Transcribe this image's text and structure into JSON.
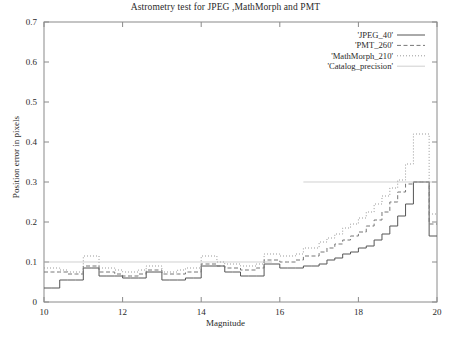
{
  "chart_data": {
    "type": "line",
    "title": "Astrometry test for JPEG ,MathMorph and PMT",
    "xlabel": "Magnitude",
    "ylabel": "Position error in pixels",
    "xlim": [
      10,
      20
    ],
    "ylim": [
      0,
      0.7
    ],
    "xticks": [
      10,
      12,
      14,
      16,
      18,
      20
    ],
    "xtick_labels": [
      "10",
      "12",
      "14",
      "16",
      "18",
      "20"
    ],
    "yticks": [
      0,
      0.1,
      0.2,
      0.3,
      0.4,
      0.5,
      0.6,
      0.7
    ],
    "ytick_labels": [
      "0",
      "0.1",
      "0.2",
      "0.3",
      "0.4",
      "0.5",
      "0.6",
      "0.7"
    ],
    "grid": false,
    "legend_position": "top-right",
    "drawstyle": "steps-post",
    "series": [
      {
        "name": "'JPEG_40'",
        "style": "solid",
        "color": "#555555",
        "x": [
          10.0,
          10.2,
          10.4,
          10.6,
          10.8,
          11.0,
          11.2,
          11.4,
          11.6,
          11.8,
          12.0,
          12.2,
          12.4,
          12.6,
          12.8,
          13.0,
          13.2,
          13.4,
          13.6,
          13.8,
          14.0,
          14.2,
          14.4,
          14.6,
          14.8,
          15.0,
          15.2,
          15.4,
          15.6,
          15.8,
          16.0,
          16.2,
          16.4,
          16.6,
          16.8,
          17.0,
          17.2,
          17.4,
          17.6,
          17.8,
          18.0,
          18.2,
          18.4,
          18.6,
          18.8,
          19.0,
          19.2,
          19.4,
          19.6,
          19.8,
          20.0
        ],
        "y": [
          0.035,
          0.035,
          0.055,
          0.055,
          0.055,
          0.085,
          0.085,
          0.065,
          0.065,
          0.065,
          0.06,
          0.06,
          0.06,
          0.075,
          0.075,
          0.055,
          0.055,
          0.055,
          0.06,
          0.06,
          0.09,
          0.09,
          0.09,
          0.075,
          0.075,
          0.065,
          0.065,
          0.065,
          0.095,
          0.095,
          0.085,
          0.085,
          0.085,
          0.09,
          0.09,
          0.095,
          0.105,
          0.11,
          0.12,
          0.125,
          0.135,
          0.14,
          0.155,
          0.17,
          0.19,
          0.215,
          0.245,
          0.3,
          0.3,
          0.165,
          0.165
        ]
      },
      {
        "name": "'PMT_260'",
        "style": "dashed",
        "color": "#777777",
        "x": [
          10.0,
          10.2,
          10.4,
          10.6,
          10.8,
          11.0,
          11.2,
          11.4,
          11.6,
          11.8,
          12.0,
          12.2,
          12.4,
          12.6,
          12.8,
          13.0,
          13.2,
          13.4,
          13.6,
          13.8,
          14.0,
          14.2,
          14.4,
          14.6,
          14.8,
          15.0,
          15.2,
          15.4,
          15.6,
          15.8,
          16.0,
          16.2,
          16.4,
          16.6,
          16.8,
          17.0,
          17.2,
          17.4,
          17.6,
          17.8,
          18.0,
          18.2,
          18.4,
          18.6,
          18.8,
          19.0,
          19.2,
          19.4,
          19.6,
          19.8,
          20.0
        ],
        "y": [
          0.075,
          0.075,
          0.075,
          0.07,
          0.07,
          0.09,
          0.09,
          0.075,
          0.075,
          0.07,
          0.065,
          0.065,
          0.07,
          0.08,
          0.08,
          0.07,
          0.07,
          0.07,
          0.075,
          0.075,
          0.095,
          0.095,
          0.09,
          0.085,
          0.085,
          0.08,
          0.08,
          0.085,
          0.105,
          0.105,
          0.1,
          0.1,
          0.105,
          0.115,
          0.115,
          0.125,
          0.135,
          0.145,
          0.155,
          0.165,
          0.175,
          0.19,
          0.205,
          0.225,
          0.25,
          0.275,
          0.295,
          0.3,
          0.3,
          0.195,
          0.195
        ]
      },
      {
        "name": "'MathMorph_210'",
        "style": "dotted",
        "color": "#999999",
        "x": [
          10.0,
          10.2,
          10.4,
          10.6,
          10.8,
          11.0,
          11.2,
          11.4,
          11.6,
          11.8,
          12.0,
          12.2,
          12.4,
          12.6,
          12.8,
          13.0,
          13.2,
          13.4,
          13.6,
          13.8,
          14.0,
          14.2,
          14.4,
          14.6,
          14.8,
          15.0,
          15.2,
          15.4,
          15.6,
          15.8,
          16.0,
          16.2,
          16.4,
          16.6,
          16.8,
          17.0,
          17.2,
          17.4,
          17.6,
          17.8,
          18.0,
          18.2,
          18.4,
          18.6,
          18.8,
          19.0,
          19.2,
          19.4,
          19.6,
          19.8,
          20.0
        ],
        "y": [
          0.085,
          0.085,
          0.08,
          0.075,
          0.075,
          0.115,
          0.115,
          0.085,
          0.085,
          0.08,
          0.075,
          0.075,
          0.08,
          0.09,
          0.09,
          0.075,
          0.075,
          0.08,
          0.085,
          0.085,
          0.115,
          0.115,
          0.1,
          0.095,
          0.095,
          0.09,
          0.09,
          0.095,
          0.12,
          0.12,
          0.115,
          0.115,
          0.12,
          0.135,
          0.135,
          0.15,
          0.16,
          0.17,
          0.185,
          0.195,
          0.21,
          0.225,
          0.245,
          0.265,
          0.285,
          0.305,
          0.345,
          0.42,
          0.42,
          0.22,
          0.22
        ]
      },
      {
        "name": "'Catalog_precision'",
        "style": "solid-thin",
        "color": "#bbbbbb",
        "segments": [
          {
            "x": [
              10.0,
              15.8
            ],
            "y": [
              0.1,
              0.1
            ]
          },
          {
            "x": [
              16.6,
              20.0
            ],
            "y": [
              0.3,
              0.3
            ]
          }
        ]
      }
    ]
  }
}
